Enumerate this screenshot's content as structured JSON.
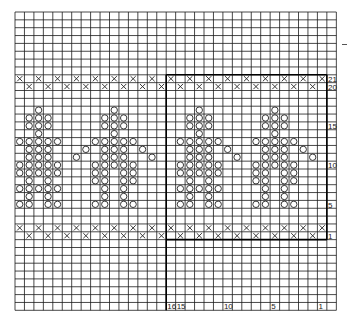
{
  "chart": {
    "columns": 33,
    "rows_total": 38,
    "grid": {
      "left": 15,
      "top": 12,
      "cell_w": 9.45,
      "cell_h": 7.85
    },
    "first_pattern_row_index": 8,
    "pattern_rows": 21,
    "repeat_divider_col": 16,
    "line_color": "#1a1a1a",
    "symbol_color": "#222222",
    "row_labels": [
      "21",
      "20",
      "15",
      "10",
      "5",
      "1"
    ],
    "row_label_rows": [
      21,
      20,
      15,
      10,
      5,
      1
    ],
    "col_labels": [
      {
        "text": "16",
        "col": 16
      },
      {
        "text": "15",
        "col": 17
      },
      {
        "text": "10",
        "col": 22
      },
      {
        "text": "5",
        "col": 27
      },
      {
        "text": "1",
        "col": 32
      }
    ],
    "legend": {
      "x_symbol": "×",
      "o_symbol": "○"
    }
  },
  "chart_data": {
    "type": "table",
    "xlabel": "Stitch number (1 at right, 16-stitch repeat)",
    "ylabel": "Row number (1 at bottom)",
    "x_ticks": [
      "16",
      "15",
      "10",
      "5",
      "1"
    ],
    "y_ticks": [
      "21",
      "20",
      "15",
      "10",
      "5",
      "1"
    ],
    "x_rows": {
      "21": "even",
      "20": "odd",
      "2": "even",
      "1": "odd"
    },
    "motifs": {
      "A": {
        "17": [
          0
        ],
        "16": [
          -1,
          0,
          1
        ],
        "15": [
          -1,
          0,
          1
        ],
        "14": [
          0
        ],
        "13": [
          -2,
          -1,
          0,
          1,
          2
        ],
        "12": [
          -1,
          0,
          1,
          3,
          5
        ],
        "11": [
          -1,
          0,
          1,
          4
        ],
        "10": [
          -2,
          -1,
          0,
          1,
          2
        ],
        "9": [
          -2,
          -1,
          0,
          1,
          2,
          3
        ],
        "8": [
          -1,
          1,
          3
        ],
        "7": [
          -2,
          -1,
          0,
          1,
          2,
          3
        ],
        "6": [
          -1,
          1
        ],
        "5": [
          -2,
          -1,
          1,
          2
        ]
      },
      "B": {
        "17": [
          0
        ],
        "16": [
          -1,
          0,
          1
        ],
        "15": [
          -1,
          0,
          1
        ],
        "14": [
          0
        ],
        "13": [
          -2,
          -1,
          0,
          1,
          2
        ],
        "12": [
          -1,
          0,
          1
        ],
        "11": [
          -1,
          0,
          1
        ],
        "10": [
          -2,
          -1,
          0,
          1,
          2
        ],
        "9": [
          -2,
          -1,
          1,
          2
        ],
        "8": [
          -2,
          -1,
          1,
          2
        ],
        "7": [
          -1,
          1
        ],
        "6": [
          -1,
          1
        ],
        "5": [
          -2,
          -1,
          1,
          2
        ]
      }
    },
    "motif_placements": [
      {
        "motif": "A",
        "center_col": 2
      },
      {
        "motif": "B",
        "center_col": 10
      },
      {
        "motif": "A",
        "center_col": 19
      },
      {
        "motif": "B",
        "center_col": 27
      }
    ],
    "extra_o": [
      {
        "row": 12,
        "col": 22
      },
      {
        "row": 11,
        "col": 23
      },
      {
        "row": 12,
        "col": 30
      },
      {
        "row": 11,
        "col": 31
      },
      {
        "row": 12,
        "col": 7
      },
      {
        "row": 11,
        "col": 6
      },
      {
        "row": 12,
        "col": 13
      },
      {
        "row": 11,
        "col": 14
      }
    ]
  }
}
